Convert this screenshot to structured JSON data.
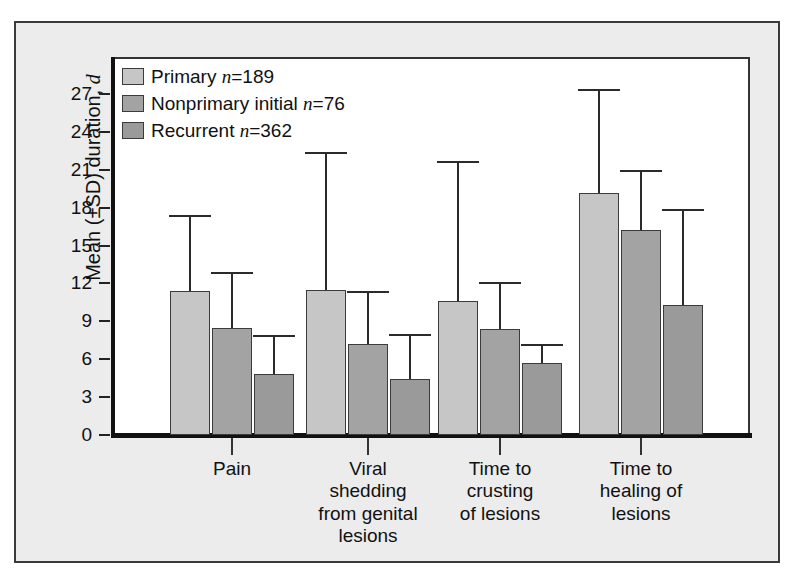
{
  "chart_data": {
    "type": "bar",
    "title": "",
    "subtitle": "",
    "xlabel": "",
    "ylabel": "Mean (±SD) duration, d",
    "ylim": [
      0,
      28.5
    ],
    "yticks": [
      0,
      3,
      6,
      9,
      12,
      15,
      18,
      21,
      24,
      27
    ],
    "grid": false,
    "legend_position": "top-left",
    "error_bars": "upper SD only",
    "categories": [
      "Pain",
      "Viral shedding from genital lesions",
      "Time to crusting of lesions",
      "Time to healing of lesions"
    ],
    "category_label_lines": [
      [
        "Pain"
      ],
      [
        "Viral",
        "shedding",
        "from genital",
        "lesions"
      ],
      [
        "Time to",
        "crusting",
        "of lesions"
      ],
      [
        "Time to",
        "healing of",
        "lesions"
      ]
    ],
    "series": [
      {
        "name": "Primary",
        "n": 189,
        "color": "#c6c6c6",
        "values": [
          11.4,
          11.5,
          10.6,
          19.2
        ],
        "upper_error": [
          17.4,
          22.4,
          21.7,
          27.4
        ]
      },
      {
        "name": "Nonprimary initial",
        "n": 76,
        "color": "#a3a3a3",
        "values": [
          8.5,
          7.2,
          8.4,
          16.2
        ],
        "upper_error": [
          12.9,
          11.4,
          12.1,
          21.0
        ]
      },
      {
        "name": "Recurrent",
        "n": 362,
        "color": "#9a9a9a",
        "values": [
          4.8,
          4.4,
          5.7,
          10.3
        ],
        "upper_error": [
          7.9,
          8.0,
          7.2,
          17.9
        ]
      }
    ]
  },
  "legend": {
    "items": [
      {
        "label": "Primary",
        "n_prefix": "n",
        "n_value": "=189"
      },
      {
        "label": "Nonprimary initial",
        "n_prefix": "n",
        "n_value": "=76"
      },
      {
        "label": "Recurrent",
        "n_prefix": "n",
        "n_value": "=362"
      }
    ]
  },
  "axes": {
    "y_title_main": "Mean (±SD) duration,",
    "y_title_italic": "d",
    "y_tick_labels": [
      "27",
      "24",
      "21",
      "18",
      "15",
      "12",
      "9",
      "6",
      "3",
      "0"
    ]
  }
}
